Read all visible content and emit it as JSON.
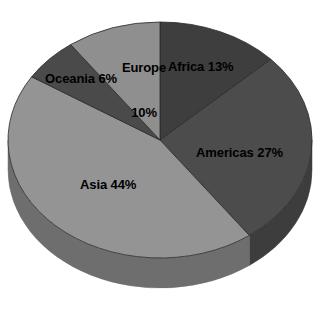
{
  "chart_data": {
    "type": "pie",
    "title": "",
    "subtitle": "",
    "xlabel": "",
    "ylabel": "",
    "legend_position": "none",
    "grid": false,
    "labels_inside": true,
    "three_d": true,
    "start_angle_deg": 0,
    "direction": "clockwise",
    "categories": [
      "Africa",
      "Americas",
      "Asia",
      "Oceania",
      "Europe"
    ],
    "values": [
      13,
      27,
      44,
      6,
      10
    ],
    "unit": "%",
    "slices": [
      {
        "name": "Africa",
        "value": 13,
        "label": "Africa 13%",
        "color": "#3e3e3e",
        "side_color": "#333333",
        "start_deg": 0,
        "end_deg": 46.8
      },
      {
        "name": "Americas",
        "value": 27,
        "label": "Americas 27%",
        "color": "#4c4c4c",
        "side_color": "#3d3d3d",
        "start_deg": 46.8,
        "end_deg": 144.0
      },
      {
        "name": "Asia",
        "value": 44,
        "label": "Asia 44%",
        "color": "#949494",
        "side_color": "#6e6e6e",
        "start_deg": 144.0,
        "end_deg": 302.4
      },
      {
        "name": "Oceania",
        "value": 6,
        "label": "Oceania 6%",
        "color": "#4a4a4a",
        "side_color": "#3b3b3b",
        "start_deg": 302.4,
        "end_deg": 324.0
      },
      {
        "name": "Europe",
        "value": 10,
        "label": "Europe\n10%",
        "label_line1": "Europe",
        "label_line2": "10%",
        "color": "#8f8f8f",
        "side_color": "#6e6e6e",
        "start_deg": 324.0,
        "end_deg": 360.0
      }
    ],
    "colors": {
      "background": "#ffffff",
      "label_text": "#000000",
      "africa": "#3e3e3e",
      "americas": "#4c4c4c",
      "asia": "#949494",
      "oceania": "#4a4a4a",
      "europe": "#8f8f8f"
    },
    "geometry": {
      "cx": 160,
      "cy": 140,
      "rx": 152,
      "ry": 118,
      "depth": 30
    }
  }
}
